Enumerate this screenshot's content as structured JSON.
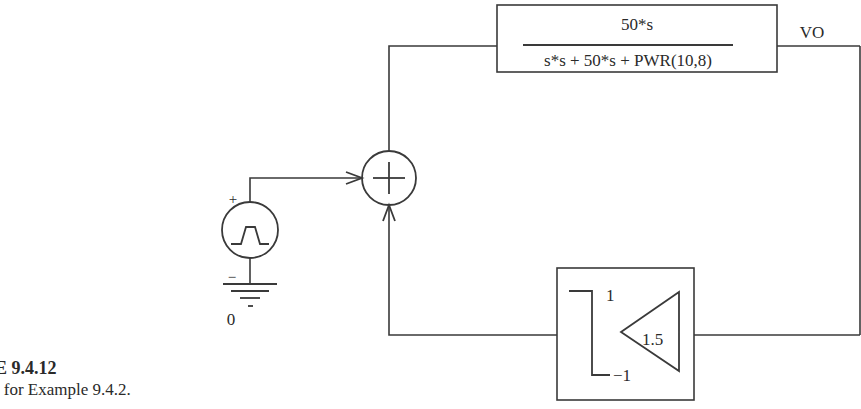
{
  "figure": {
    "title": "RE 9.4.12",
    "caption": "e for Example 9.4.2."
  },
  "transfer_block": {
    "numerator": "50*s",
    "denominator": "s*s + 50*s + PWR(10,8)"
  },
  "output_label": "VO",
  "source": {
    "plus_label": "+",
    "minus_label": "−",
    "ground_node_label": "0",
    "ground_tick_label": "-"
  },
  "summer": {
    "symbol": "+"
  },
  "feedback_block": {
    "gain": "1.5",
    "limit_high": "1",
    "limit_low": "−1"
  }
}
